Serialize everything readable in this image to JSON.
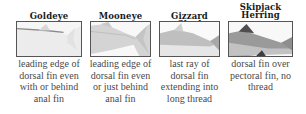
{
  "panels": [
    {
      "title": "Goldeye",
      "caption_lines": [
        "leading edge of",
        "dorsal fin even",
        "with or behind",
        "anal fin"
      ],
      "image": "goldeye-fish-tail-photo"
    },
    {
      "title": "Mooneye",
      "caption_lines": [
        "leading edge of",
        "dorsal fin even",
        "or just behind",
        "anal fin"
      ],
      "image": "mooneye-fish-tail-photo"
    },
    {
      "title": "Gizzard Shad",
      "caption_lines": [
        "last ray of",
        "dorsal fin",
        "extending into",
        "long thread"
      ],
      "image": "gizzard-shad-fish-photo"
    },
    {
      "title_lines": [
        "Skipjack",
        "Herring"
      ],
      "caption_lines": [
        "dorsal fin over",
        "pectoral fin, no",
        "thread"
      ],
      "image": "skipjack-herring-fish-photo"
    }
  ]
}
